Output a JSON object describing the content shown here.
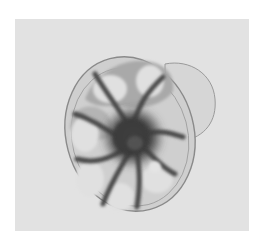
{
  "figure": {
    "kind": "micrograph",
    "colors": {
      "background_page": "#ffffff",
      "photo_background": "#e2e2e2",
      "test_wall": "#8a8a8a",
      "chamber_fill": "#c9c9c9",
      "cytoplasm_dark": "#3a3a3a"
    },
    "caption": ""
  }
}
